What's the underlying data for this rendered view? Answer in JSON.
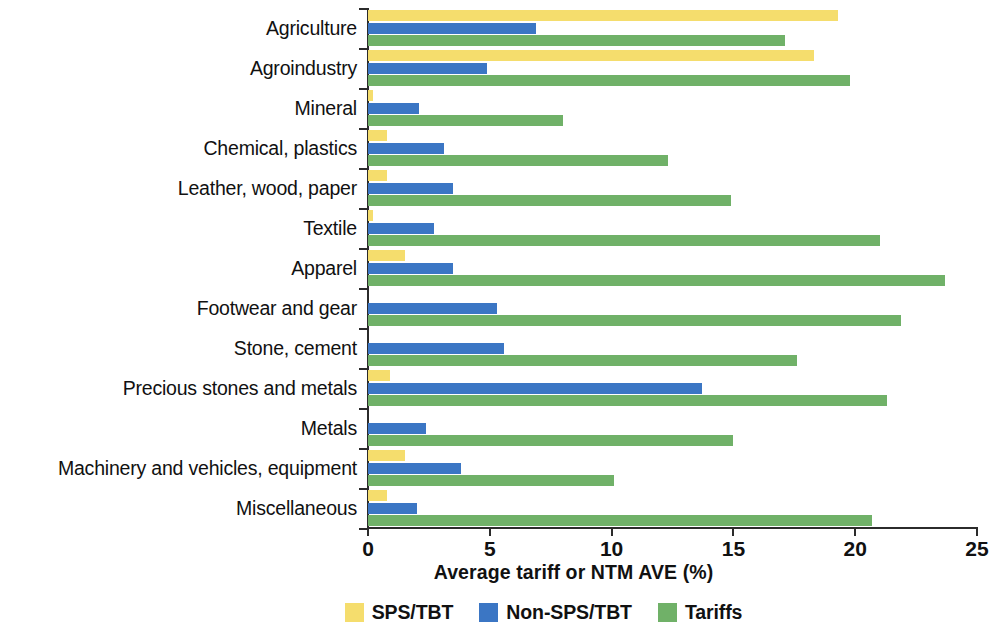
{
  "chart_data": {
    "type": "bar",
    "orientation": "horizontal",
    "title": "",
    "xlabel": "Average tariff or NTM AVE (%)",
    "ylabel": "",
    "xlim": [
      0,
      25
    ],
    "xticks": [
      0,
      5,
      10,
      15,
      20,
      25
    ],
    "grid": false,
    "legend_position": "bottom",
    "categories": [
      "Agriculture",
      "Agroindustry",
      "Mineral",
      "Chemical, plastics",
      "Leather, wood, paper",
      "Textile",
      "Apparel",
      "Footwear and gear",
      "Stone, cement",
      "Precious stones and metals",
      "Metals",
      "Machinery and vehicles, equipment",
      "Miscellaneous"
    ],
    "series": [
      {
        "name": "SPS/TBT",
        "color": "#f5dd6d",
        "values": [
          19.3,
          18.3,
          0.2,
          0.8,
          0.8,
          0.2,
          1.5,
          0.0,
          0.0,
          0.9,
          0.0,
          1.5,
          0.8
        ]
      },
      {
        "name": "Non-SPS/TBT",
        "color": "#3b76c4",
        "values": [
          6.9,
          4.9,
          2.1,
          3.1,
          3.5,
          2.7,
          3.5,
          5.3,
          5.6,
          13.7,
          2.4,
          3.8,
          2.0
        ]
      },
      {
        "name": "Tariffs",
        "color": "#70b168",
        "values": [
          17.1,
          19.8,
          8.0,
          12.3,
          14.9,
          21.0,
          23.7,
          21.9,
          17.6,
          21.3,
          15.0,
          10.1,
          20.7
        ]
      }
    ]
  },
  "legend": {
    "entries": [
      {
        "label": "SPS/TBT",
        "color": "#f5dd6d"
      },
      {
        "label": "Non-SPS/TBT",
        "color": "#3b76c4"
      },
      {
        "label": "Tariffs",
        "color": "#70b168"
      }
    ]
  }
}
